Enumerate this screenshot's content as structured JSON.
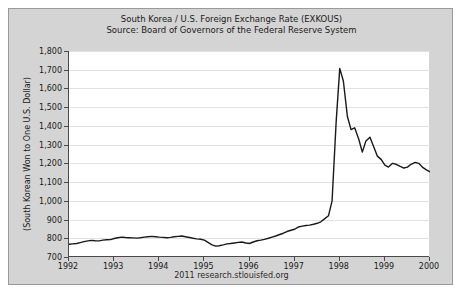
{
  "chart_data": {
    "type": "line",
    "title": "South Korea / U.S. Foreign Exchange Rate (EXKOUS)",
    "subtitle": "Source: Board of Governors of the Federal Reserve System",
    "xlabel": "",
    "ylabel": "(South Korean Won to One U.S. Dollar)",
    "xlim": [
      1992,
      2000
    ],
    "ylim": [
      700,
      1800
    ],
    "grid": true,
    "legend": false,
    "line_color": "#1a1a1a",
    "plot_background": "#ffffff",
    "panel_background": "#d4d4d4",
    "footer": "2011 research.stlouisfed.org",
    "ytick_labels": [
      "1,800",
      "1,700",
      "1,600",
      "1,500",
      "1,400",
      "1,300",
      "1,200",
      "1,100",
      "1,000",
      "900",
      "800",
      "700"
    ],
    "ytick_values": [
      1800,
      1700,
      1600,
      1500,
      1400,
      1300,
      1200,
      1100,
      1000,
      900,
      800,
      700
    ],
    "xtick_labels": [
      "1992",
      "1993",
      "1994",
      "1995",
      "1996",
      "1997",
      "1998",
      "1999",
      "2000"
    ],
    "xtick_values": [
      1992,
      1993,
      1994,
      1995,
      1996,
      1997,
      1998,
      1999,
      2000
    ],
    "series": [
      {
        "name": "EXKOUS",
        "x": [
          1992.0,
          1992.08,
          1992.17,
          1992.25,
          1992.33,
          1992.42,
          1992.5,
          1992.58,
          1992.67,
          1992.75,
          1992.83,
          1992.92,
          1993.0,
          1993.08,
          1993.17,
          1993.25,
          1993.33,
          1993.42,
          1993.5,
          1993.58,
          1993.67,
          1993.75,
          1993.83,
          1993.92,
          1994.0,
          1994.08,
          1994.17,
          1994.25,
          1994.33,
          1994.42,
          1994.5,
          1994.58,
          1994.67,
          1994.75,
          1994.83,
          1994.92,
          1995.0,
          1995.08,
          1995.17,
          1995.25,
          1995.33,
          1995.42,
          1995.5,
          1995.58,
          1995.67,
          1995.75,
          1995.83,
          1995.92,
          1996.0,
          1996.08,
          1996.17,
          1996.25,
          1996.33,
          1996.42,
          1996.5,
          1996.58,
          1996.67,
          1996.75,
          1996.83,
          1996.92,
          1997.0,
          1997.08,
          1997.17,
          1997.25,
          1997.33,
          1997.42,
          1997.5,
          1997.58,
          1997.67,
          1997.75,
          1997.83,
          1997.92,
          1998.0,
          1998.08,
          1998.17,
          1998.25,
          1998.33,
          1998.42,
          1998.5,
          1998.58,
          1998.67,
          1998.75,
          1998.83,
          1998.92,
          1999.0,
          1999.08,
          1999.17,
          1999.25,
          1999.33,
          1999.42,
          1999.5,
          1999.58,
          1999.67,
          1999.75,
          1999.83,
          1999.92,
          2000.0
        ],
        "values": [
          768,
          770,
          772,
          777,
          782,
          786,
          789,
          787,
          786,
          790,
          792,
          793,
          799,
          803,
          806,
          804,
          803,
          802,
          801,
          803,
          806,
          808,
          810,
          808,
          806,
          805,
          803,
          805,
          808,
          810,
          812,
          808,
          804,
          800,
          797,
          795,
          790,
          778,
          765,
          758,
          760,
          765,
          770,
          772,
          775,
          778,
          780,
          775,
          772,
          780,
          787,
          790,
          794,
          800,
          806,
          812,
          820,
          827,
          836,
          843,
          848,
          860,
          865,
          868,
          870,
          875,
          880,
          888,
          905,
          920,
          1000,
          1420,
          1707,
          1640,
          1450,
          1380,
          1390,
          1330,
          1260,
          1320,
          1340,
          1290,
          1240,
          1220,
          1190,
          1180,
          1200,
          1195,
          1185,
          1175,
          1180,
          1195,
          1205,
          1200,
          1180,
          1165,
          1155
        ],
        "peak_value": 1707,
        "peak_date": "1998.00",
        "start_value": 768,
        "end_value": 1155
      }
    ]
  }
}
